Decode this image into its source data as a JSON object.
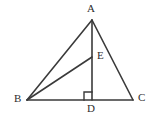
{
  "figure": {
    "background_color": "#ffffff",
    "stroke_color": "#3a3a3a",
    "label_color": "#2e2e2e",
    "labels": {
      "A": "A",
      "B": "B",
      "C": "C",
      "D": "D",
      "E": "E"
    },
    "points": {
      "A": {
        "x": 92,
        "y": 20,
        "label_position": "above"
      },
      "B": {
        "x": 27,
        "y": 100,
        "label_position": "left"
      },
      "C": {
        "x": 133,
        "y": 100,
        "label_position": "right"
      },
      "D": {
        "x": 92,
        "y": 100,
        "label_position": "below"
      },
      "E": {
        "x": 92,
        "y": 57,
        "label_position": "right"
      }
    },
    "segments": [
      {
        "name": "AB",
        "from": "A",
        "to": "B"
      },
      {
        "name": "AC",
        "from": "A",
        "to": "C"
      },
      {
        "name": "BC",
        "from": "B",
        "to": "C"
      },
      {
        "name": "AD",
        "from": "A",
        "to": "D"
      },
      {
        "name": "BE",
        "from": "B",
        "to": "E"
      }
    ],
    "right_angle_marker": {
      "at": "D",
      "size": 8,
      "side": "left",
      "between": [
        "DA",
        "DB"
      ]
    }
  }
}
